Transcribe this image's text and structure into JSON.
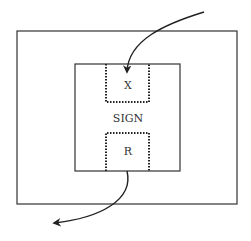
{
  "diagram": {
    "outer_box": {
      "label": ""
    },
    "inner_box": {
      "label": "SIGN"
    },
    "input_region": {
      "label": "X"
    },
    "output_region": {
      "label": "R"
    },
    "arrows": [
      {
        "name": "input-arrow",
        "from": "outside-top-right",
        "to": "X"
      },
      {
        "name": "output-arrow",
        "from": "R",
        "to": "outside-bottom-left"
      }
    ],
    "colors": {
      "stroke": "#222222",
      "background": "#ffffff"
    }
  }
}
